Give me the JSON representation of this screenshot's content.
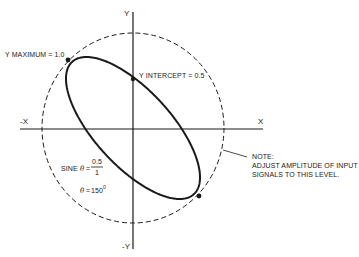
{
  "diagram": {
    "type": "lissajous-phase-diagram",
    "colors": {
      "ink": "#1a1a1a",
      "background": "#ffffff"
    },
    "axes": {
      "x_pos_label": "X",
      "x_neg_label": "-X",
      "y_pos_label": "Y",
      "y_neg_label": "-Y"
    },
    "reference_circle": {
      "style": "dashed",
      "normalized_radius": 1.0
    },
    "ellipse": {
      "y_maximum": 1.0,
      "y_intercept": 0.5,
      "phase_deg": 150
    },
    "labels": {
      "y_maximum": "Y MAXIMUM = 1.0",
      "y_intercept": "Y INTERCEPT = 0.5",
      "sine_prefix": "SINE",
      "theta_symbol": "θ",
      "equals": "=",
      "sine_numerator": "0.5",
      "sine_denominator": "1",
      "theta_value": "150",
      "degree_mark": "0"
    },
    "note": {
      "title": "NOTE:",
      "line1": "ADJUST AMPLITUDE OF INPUT",
      "line2": "SIGNALS TO THIS LEVEL."
    }
  }
}
